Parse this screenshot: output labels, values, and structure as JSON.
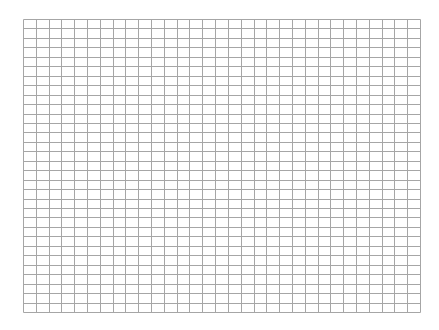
{
  "grid": {
    "columns": 31,
    "rows": 31,
    "left": 22.5,
    "top": 19,
    "width": 397,
    "height": 293,
    "line_color": "#a6a6a6",
    "background_color": "#ffffff",
    "line_width": 1
  }
}
